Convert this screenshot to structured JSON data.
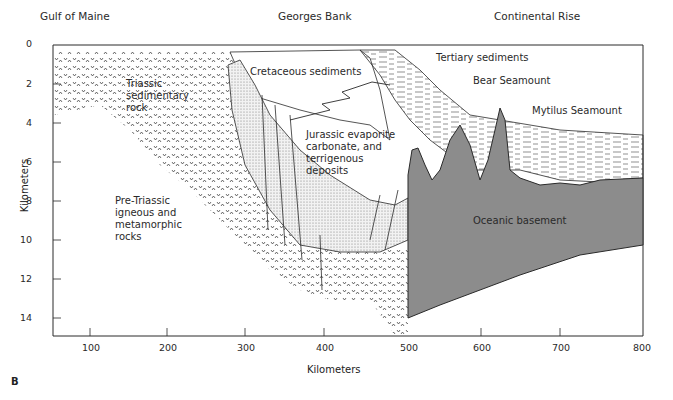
{
  "figure": {
    "panel_label": "B",
    "regions": [
      "Gulf of Maine",
      "Georges Bank",
      "Continental Rise"
    ],
    "x_axis": {
      "label": "Kilometers",
      "ticks": [
        "100",
        "200",
        "300",
        "400",
        "500",
        "600",
        "700",
        "800"
      ]
    },
    "y_axis": {
      "label": "Kilometers",
      "ticks": [
        "0",
        "2",
        "4",
        "6",
        "8",
        "10",
        "12",
        "14"
      ]
    },
    "units": {
      "triassic": "Triassic\nsedimentary\nrock",
      "pre_triassic": "Pre-Triassic\nigneous and\nmetamorphic\nrocks",
      "cretaceous": "Cretaceous sediments",
      "jurassic": "Jurassic evaporite\ncarbonate, and\nterrigenous\ndeposits",
      "tertiary": "Tertiary sediments",
      "bear": "Bear Seamount",
      "mytilus": "Mytilus Seamount",
      "oceanic": "Oceanic basement"
    },
    "colors": {
      "basement": "#8c8c8c",
      "line": "#2a2a2a",
      "stipple": "#d9d9d9"
    }
  }
}
